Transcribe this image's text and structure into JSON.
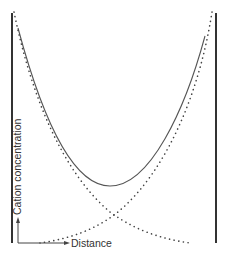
{
  "diagram": {
    "type": "cation concentration profile between two walls",
    "labels": {
      "y_axis": "Cation concentration",
      "x_axis": "Distance"
    },
    "elements": {
      "left_wall": "vertical surface",
      "right_wall": "vertical surface",
      "solid_curve": "total cation concentration (U-shaped, minimum at midplane)",
      "dotted_curve_left": "cation concentration decaying from left wall",
      "dotted_curve_right": "cation concentration decaying from right wall"
    },
    "colors": {
      "background": "#ffffff",
      "lines": "#444444"
    }
  }
}
